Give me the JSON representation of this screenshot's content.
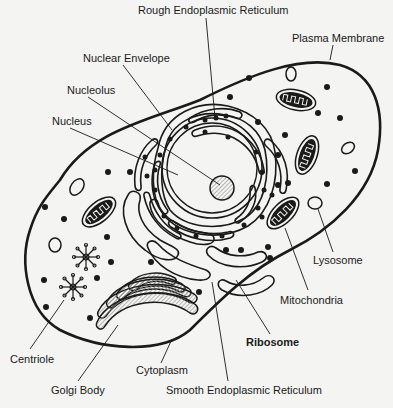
{
  "colors": {
    "background": "#f4f4f2",
    "line": "#1a1a1a",
    "hatch": "#9a9a9a"
  },
  "labels": {
    "rough_er": {
      "text": "Rough Endoplasmic Reticulum",
      "x": 138,
      "y": 10
    },
    "plasma_membrane": {
      "text": "Plasma Membrane",
      "x": 292,
      "y": 37
    },
    "nuclear_envelope": {
      "text": "Nuclear Envelope",
      "x": 83,
      "y": 53
    },
    "nucleolus": {
      "text": "Nucleolus",
      "x": 67,
      "y": 85
    },
    "nucleus": {
      "text": "Nucleus",
      "x": 52,
      "y": 116
    },
    "lysosome": {
      "text": "Lysosome",
      "x": 313,
      "y": 254
    },
    "mitochondria": {
      "text": "Mitochondria",
      "x": 280,
      "y": 294
    },
    "ribosome": {
      "text": "Ribosome",
      "x": 246,
      "y": 336
    },
    "centriole": {
      "text": "Centriole",
      "x": 10,
      "y": 354
    },
    "cytoplasm": {
      "text": "Cytoplasm",
      "x": 136,
      "y": 366
    },
    "golgi_body": {
      "text": "Golgi Body",
      "x": 51,
      "y": 385
    },
    "smooth_er": {
      "text": "Smooth Endoplasmic Reticulum",
      "x": 166,
      "y": 385
    }
  }
}
